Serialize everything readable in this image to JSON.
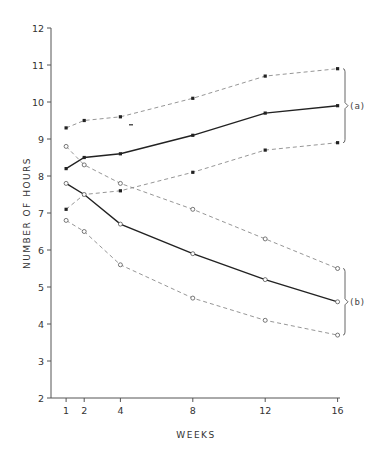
{
  "chart_data": {
    "type": "line",
    "title": "",
    "xlabel": "WEEKS",
    "ylabel": "NUMBER OF HOURS",
    "x": [
      1,
      2,
      4,
      8,
      12,
      16
    ],
    "x_ticks": [
      1,
      2,
      4,
      8,
      12,
      16
    ],
    "y_ticks": [
      2,
      3,
      4,
      5,
      6,
      7,
      8,
      9,
      10,
      11,
      12
    ],
    "ylim": [
      2,
      12
    ],
    "grid": false,
    "legend": "bracket labels at right: (a), (b)",
    "series": [
      {
        "name": "(a) upper bound",
        "group": "a",
        "style": "dashed",
        "marker": "filled",
        "values": [
          9.3,
          9.5,
          9.6,
          10.1,
          10.7,
          10.9
        ]
      },
      {
        "name": "(a) mean",
        "group": "a",
        "style": "solid",
        "marker": "filled",
        "values": [
          8.2,
          8.5,
          8.6,
          9.1,
          9.7,
          9.9
        ]
      },
      {
        "name": "(a) lower bound",
        "group": "a",
        "style": "dashed",
        "marker": "filled",
        "values": [
          7.1,
          7.5,
          7.6,
          8.1,
          8.7,
          8.9
        ]
      },
      {
        "name": "(b) upper bound",
        "group": "b",
        "style": "dashed",
        "marker": "open",
        "values": [
          8.8,
          8.3,
          7.8,
          7.1,
          6.3,
          5.5
        ]
      },
      {
        "name": "(b) mean",
        "group": "b",
        "style": "solid",
        "marker": "open",
        "values": [
          7.8,
          7.5,
          6.7,
          5.9,
          5.2,
          4.6
        ]
      },
      {
        "name": "(b) lower bound",
        "group": "b",
        "style": "dashed",
        "marker": "open",
        "values": [
          6.8,
          6.5,
          5.6,
          4.7,
          4.1,
          3.7
        ]
      }
    ],
    "group_labels": [
      {
        "group": "a",
        "label": "(a)"
      },
      {
        "group": "b",
        "label": "(b)"
      }
    ]
  },
  "layout": {
    "colors": {
      "axis": "#555555",
      "solid": "#222222",
      "dashed": "#8a8a8a",
      "marker": "#222222"
    }
  }
}
